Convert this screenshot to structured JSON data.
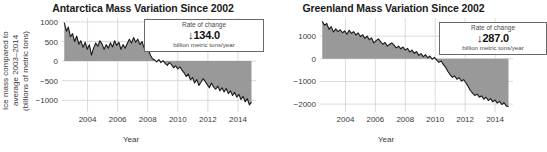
{
  "colors": {
    "fill": "#999999",
    "line": "#1a1a1a",
    "grid": "#cccccc",
    "text": "#3a3a3a",
    "title": "#1a1a1a",
    "box_border": "#6a6a6a",
    "background": "#ffffff"
  },
  "panels": {
    "antarctica": {
      "title": "Antarctica Mass Variation Since 2002",
      "ylabel_line1": "Ice mass compared to",
      "ylabel_line2": "average 2003–2014",
      "ylabel_line3": "(billions of metric tons)",
      "xlabel": "Year",
      "rate_title": "Rate of change",
      "rate_arrow": "↓",
      "rate_value": "134.0",
      "rate_units": "billion metric tons/year"
    },
    "greenland": {
      "title": "Greenland Mass Variation Since 2002",
      "xlabel": "Year",
      "rate_title": "Rate of change",
      "rate_arrow": "↓",
      "rate_value": "287.0",
      "rate_units": "billion metric tons/year"
    }
  },
  "chart_data": [
    {
      "id": "antarctica",
      "type": "area",
      "title": "Antarctica Mass Variation Since 2002",
      "xlabel": "Year",
      "ylabel": "Ice mass compared to average 2003–2014 (billions of metric tons)",
      "xlim": [
        2002.3,
        2015.2
      ],
      "ylim": [
        -1300,
        1100
      ],
      "xticks": [
        2004,
        2006,
        2008,
        2010,
        2012,
        2014
      ],
      "yticks": [
        1000,
        500,
        0,
        -500,
        -1000
      ],
      "ytick_labels": [
        "1000",
        "500",
        "0",
        "−500",
        "−1000"
      ],
      "grid": true,
      "baseline": 0,
      "annotation": {
        "rate_of_change_label": "Rate of change",
        "direction": "down",
        "magnitude": 134.0,
        "units": "billion metric tons/year"
      },
      "x": [
        2002.45,
        2002.6,
        2002.72,
        2002.86,
        2003.0,
        2003.14,
        2003.28,
        2003.42,
        2003.55,
        2003.7,
        2003.84,
        2003.98,
        2004.12,
        2004.26,
        2004.4,
        2004.54,
        2004.68,
        2004.82,
        2004.96,
        2005.1,
        2005.24,
        2005.38,
        2005.52,
        2005.66,
        2005.8,
        2005.94,
        2006.08,
        2006.22,
        2006.36,
        2006.5,
        2006.64,
        2006.78,
        2006.92,
        2007.06,
        2007.2,
        2007.34,
        2007.48,
        2007.62,
        2007.76,
        2007.9,
        2008.04,
        2008.18,
        2008.32,
        2008.46,
        2008.6,
        2008.74,
        2008.88,
        2009.02,
        2009.16,
        2009.3,
        2009.44,
        2009.58,
        2009.72,
        2009.86,
        2010.0,
        2010.14,
        2010.28,
        2010.42,
        2010.56,
        2010.7,
        2010.84,
        2010.98,
        2011.12,
        2011.26,
        2011.4,
        2011.54,
        2011.68,
        2011.82,
        2011.96,
        2012.1,
        2012.24,
        2012.38,
        2012.52,
        2012.66,
        2012.8,
        2012.94,
        2013.08,
        2013.22,
        2013.36,
        2013.5,
        2013.64,
        2013.78,
        2013.92,
        2014.06,
        2014.2,
        2014.34,
        2014.48,
        2014.62,
        2014.76,
        2014.9
      ],
      "y": [
        980,
        760,
        870,
        620,
        700,
        500,
        640,
        430,
        520,
        350,
        480,
        300,
        420,
        150,
        330,
        460,
        380,
        520,
        440,
        300,
        420,
        330,
        470,
        360,
        520,
        400,
        480,
        300,
        420,
        330,
        450,
        560,
        460,
        600,
        480,
        560,
        420,
        500,
        330,
        420,
        300,
        150,
        60,
        30,
        -20,
        40,
        -40,
        10,
        -60,
        -110,
        -40,
        -90,
        -170,
        -120,
        -200,
        -150,
        -230,
        -300,
        -390,
        -330,
        -480,
        -420,
        -560,
        -470,
        -620,
        -540,
        -450,
        -520,
        -600,
        -680,
        -560,
        -660,
        -720,
        -640,
        -760,
        -680,
        -790,
        -700,
        -830,
        -760,
        -880,
        -800,
        -920,
        -850,
        -980,
        -900,
        -1040,
        -960,
        -1120,
        -1050
      ]
    },
    {
      "id": "greenland",
      "type": "area",
      "title": "Greenland Mass Variation Since 2002",
      "xlabel": "Year",
      "ylabel": "",
      "xlim": [
        2002.3,
        2015.2
      ],
      "ylim": [
        -2350,
        1800
      ],
      "xticks": [
        2004,
        2006,
        2008,
        2010,
        2012,
        2014
      ],
      "yticks": [
        1000,
        0,
        -1000,
        -2000
      ],
      "ytick_labels": [
        "1000",
        "0",
        "−1000",
        "−2000"
      ],
      "grid": true,
      "baseline": 0,
      "annotation": {
        "rate_of_change_label": "Rate of change",
        "direction": "down",
        "magnitude": 287.0,
        "units": "billion metric tons/year"
      },
      "x": [
        2002.45,
        2002.6,
        2002.75,
        2002.9,
        2003.05,
        2003.2,
        2003.35,
        2003.5,
        2003.65,
        2003.8,
        2003.95,
        2004.1,
        2004.25,
        2004.4,
        2004.55,
        2004.7,
        2004.85,
        2005.0,
        2005.15,
        2005.3,
        2005.45,
        2005.6,
        2005.75,
        2005.9,
        2006.05,
        2006.2,
        2006.35,
        2006.5,
        2006.65,
        2006.8,
        2006.95,
        2007.1,
        2007.25,
        2007.4,
        2007.55,
        2007.7,
        2007.85,
        2008.0,
        2008.15,
        2008.3,
        2008.45,
        2008.6,
        2008.75,
        2008.9,
        2009.05,
        2009.2,
        2009.35,
        2009.5,
        2009.65,
        2009.8,
        2009.95,
        2010.1,
        2010.25,
        2010.4,
        2010.55,
        2010.7,
        2010.85,
        2011.0,
        2011.15,
        2011.3,
        2011.45,
        2011.6,
        2011.75,
        2011.9,
        2012.05,
        2012.2,
        2012.35,
        2012.5,
        2012.65,
        2012.8,
        2012.95,
        2013.1,
        2013.25,
        2013.4,
        2013.55,
        2013.7,
        2013.85,
        2014.0,
        2014.15,
        2014.3,
        2014.45,
        2014.6,
        2014.75,
        2014.9
      ],
      "y": [
        1650,
        1480,
        1560,
        1300,
        1420,
        1180,
        1320,
        1200,
        1280,
        1150,
        1230,
        1080,
        1260,
        1120,
        1200,
        1050,
        1140,
        980,
        1060,
        900,
        1000,
        840,
        920,
        700,
        800,
        880,
        760,
        640,
        720,
        560,
        640,
        700,
        600,
        480,
        560,
        440,
        520,
        380,
        460,
        300,
        380,
        240,
        320,
        150,
        230,
        90,
        180,
        40,
        120,
        -20,
        60,
        -60,
        -160,
        -100,
        -260,
        -380,
        -560,
        -700,
        -820,
        -760,
        -900,
        -840,
        -980,
        -920,
        -1060,
        -1220,
        -1400,
        -1520,
        -1620,
        -1560,
        -1700,
        -1640,
        -1780,
        -1700,
        -1840,
        -1760,
        -1900,
        -1820,
        -1960,
        -1880,
        -2020,
        -1940,
        -2080,
        -2120
      ]
    }
  ]
}
